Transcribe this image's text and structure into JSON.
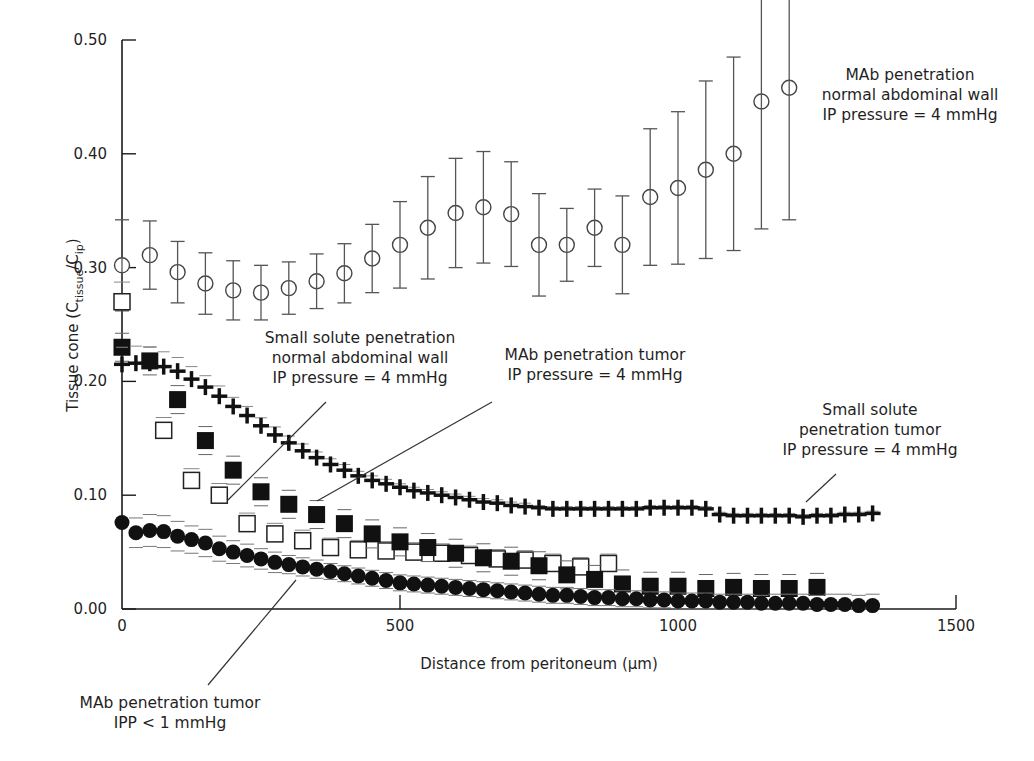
{
  "chart_data": {
    "type": "scatter",
    "title": "",
    "xlabel": "Distance from peritoneum (µm)",
    "ylabel_main": "Tissue cone (C",
    "ylabel_sub1": "tissue",
    "ylabel_mid": "/C",
    "ylabel_sub2": "ip",
    "ylabel_end": ")",
    "xlim": [
      0,
      1500
    ],
    "ylim": [
      0,
      0.5
    ],
    "x_ticks": [
      0,
      500,
      1000,
      1500
    ],
    "x_tick_labels": [
      "0",
      "500",
      "1000",
      "1500"
    ],
    "y_ticks": [
      0,
      0.1,
      0.2,
      0.3,
      0.4,
      0.5
    ],
    "y_tick_labels": [
      "0.00",
      "0.10",
      "0.20",
      "0.30",
      "0.40",
      "0.50"
    ],
    "grid": false,
    "series": [
      {
        "name": "MAb penetration normal abdominal wall, IP pressure = 4 mmHg",
        "marker": "open-circle",
        "x": [
          0,
          50,
          100,
          150,
          200,
          250,
          300,
          350,
          400,
          450,
          500,
          550,
          600,
          650,
          700,
          750,
          800,
          850,
          900,
          950,
          1000,
          1050,
          1100,
          1150,
          1200
        ],
        "y": [
          0.302,
          0.311,
          0.296,
          0.286,
          0.28,
          0.278,
          0.282,
          0.288,
          0.295,
          0.308,
          0.32,
          0.335,
          0.348,
          0.353,
          0.347,
          0.32,
          0.32,
          0.335,
          0.32,
          0.362,
          0.37,
          0.386,
          0.4,
          0.446,
          0.458
        ],
        "err": [
          0.04,
          0.03,
          0.027,
          0.027,
          0.026,
          0.024,
          0.023,
          0.024,
          0.026,
          0.03,
          0.038,
          0.045,
          0.048,
          0.049,
          0.046,
          0.045,
          0.032,
          0.034,
          0.043,
          0.06,
          0.067,
          0.078,
          0.085,
          0.112,
          0.116
        ]
      },
      {
        "name": "Small solute penetration normal abdominal wall, IP pressure = 4 mmHg",
        "marker": "open-square",
        "x": [
          0,
          75,
          125,
          175,
          225,
          275,
          325,
          375,
          425,
          475,
          525,
          575,
          625,
          675,
          725,
          775,
          825,
          875
        ],
        "y": [
          0.27,
          0.157,
          0.113,
          0.1,
          0.075,
          0.066,
          0.06,
          0.054,
          0.052,
          0.051,
          0.05,
          0.049,
          0.047,
          0.044,
          0.043,
          0.04,
          0.037,
          0.04
        ],
        "err": [
          0.012,
          0.006,
          0.005,
          0.005,
          0.004,
          0.004,
          0.004,
          0.003,
          0.003,
          0.003,
          0.003,
          0.003,
          0.003,
          0.003,
          0.003,
          0.003,
          0.003,
          0.003
        ]
      },
      {
        "name": "MAb penetration tumor, IP pressure = 4 mmHg",
        "marker": "filled-square",
        "x": [
          0,
          50,
          100,
          150,
          200,
          250,
          300,
          350,
          400,
          450,
          500,
          550,
          600,
          650,
          700,
          750,
          800,
          850,
          900,
          950,
          1000,
          1050,
          1100,
          1150,
          1200,
          1250
        ],
        "y": [
          0.23,
          0.218,
          0.184,
          0.148,
          0.122,
          0.103,
          0.092,
          0.083,
          0.075,
          0.066,
          0.059,
          0.054,
          0.049,
          0.045,
          0.042,
          0.038,
          0.03,
          0.026,
          0.022,
          0.02,
          0.02,
          0.018,
          0.019,
          0.018,
          0.018,
          0.019
        ],
        "err": [
          0.012,
          0.013,
          0.012,
          0.011,
          0.01,
          0.009,
          0.008,
          0.008,
          0.007,
          0.007,
          0.006,
          0.006,
          0.005,
          0.005,
          0.005,
          0.005,
          0.004,
          0.004,
          0.004,
          0.004,
          0.004,
          0.004,
          0.004,
          0.004,
          0.004,
          0.004
        ]
      },
      {
        "name": "Small solute penetration tumor, IP pressure = 4 mmHg",
        "marker": "cross",
        "x": [
          0,
          25,
          50,
          75,
          100,
          125,
          150,
          175,
          200,
          225,
          250,
          275,
          300,
          325,
          350,
          375,
          400,
          425,
          450,
          475,
          500,
          525,
          550,
          575,
          600,
          625,
          650,
          675,
          700,
          725,
          750,
          775,
          800,
          825,
          850,
          875,
          900,
          925,
          950,
          975,
          1000,
          1025,
          1050,
          1075,
          1100,
          1125,
          1150,
          1175,
          1200,
          1225,
          1250,
          1275,
          1300,
          1325,
          1350
        ],
        "y": [
          0.215,
          0.216,
          0.216,
          0.213,
          0.209,
          0.202,
          0.195,
          0.187,
          0.178,
          0.17,
          0.161,
          0.153,
          0.146,
          0.139,
          0.133,
          0.127,
          0.122,
          0.117,
          0.113,
          0.11,
          0.107,
          0.104,
          0.102,
          0.1,
          0.098,
          0.096,
          0.094,
          0.093,
          0.091,
          0.09,
          0.089,
          0.088,
          0.088,
          0.088,
          0.088,
          0.088,
          0.088,
          0.088,
          0.089,
          0.089,
          0.089,
          0.089,
          0.088,
          0.083,
          0.082,
          0.082,
          0.082,
          0.082,
          0.082,
          0.081,
          0.082,
          0.082,
          0.083,
          0.083,
          0.084
        ],
        "err_upper": [
          0.015,
          0.015,
          0.014,
          0.013,
          0.012,
          0.011,
          0.01,
          0.009,
          0.008,
          0.008,
          0.007,
          0.007,
          0.006,
          0.006,
          0.005,
          0.005,
          0.005,
          0.004,
          0.004,
          0.004,
          0.003,
          0.003,
          0.003,
          0.003,
          0.003,
          0.003,
          0.003,
          0.003,
          0.003,
          0.003,
          0.002,
          0.002,
          0.002,
          0.002,
          0.002,
          0.002,
          0.002,
          0.002,
          0.002,
          0.002,
          0.002,
          0.002,
          0.002,
          0.002,
          0.002,
          0.002,
          0.002,
          0.002,
          0.002,
          0.002,
          0.002,
          0.002,
          0.002,
          0.002,
          0.002
        ]
      },
      {
        "name": "MAb penetration tumor, IPP < 1 mmHg",
        "marker": "filled-circle",
        "x": [
          0,
          25,
          50,
          75,
          100,
          125,
          150,
          175,
          200,
          225,
          250,
          275,
          300,
          325,
          350,
          375,
          400,
          425,
          450,
          475,
          500,
          525,
          550,
          575,
          600,
          625,
          650,
          675,
          700,
          725,
          750,
          775,
          800,
          825,
          850,
          875,
          900,
          925,
          950,
          975,
          1000,
          1025,
          1050,
          1075,
          1100,
          1125,
          1150,
          1175,
          1200,
          1225,
          1250,
          1275,
          1300,
          1325,
          1350
        ],
        "y": [
          0.076,
          0.067,
          0.069,
          0.068,
          0.064,
          0.061,
          0.058,
          0.053,
          0.05,
          0.047,
          0.044,
          0.041,
          0.039,
          0.037,
          0.035,
          0.033,
          0.031,
          0.029,
          0.027,
          0.025,
          0.023,
          0.022,
          0.021,
          0.02,
          0.019,
          0.018,
          0.017,
          0.016,
          0.015,
          0.014,
          0.013,
          0.012,
          0.012,
          0.011,
          0.01,
          0.01,
          0.009,
          0.009,
          0.008,
          0.008,
          0.007,
          0.007,
          0.007,
          0.006,
          0.006,
          0.006,
          0.005,
          0.005,
          0.005,
          0.005,
          0.004,
          0.004,
          0.004,
          0.003,
          0.003
        ],
        "err": [
          0.0,
          0.013,
          0.014,
          0.014,
          0.013,
          0.012,
          0.012,
          0.011,
          0.01,
          0.01,
          0.009,
          0.009,
          0.008,
          0.008,
          0.008,
          0.007,
          0.007,
          0.007,
          0.007,
          0.007,
          0.007,
          0.007,
          0.007,
          0.007,
          0.007,
          0.007,
          0.007,
          0.007,
          0.007,
          0.007,
          0.007,
          0.007,
          0.007,
          0.007,
          0.007,
          0.007,
          0.007,
          0.007,
          0.007,
          0.007,
          0.007,
          0.007,
          0.007,
          0.007,
          0.007,
          0.007,
          0.007,
          0.008,
          0.008,
          0.008,
          0.008,
          0.009,
          0.009,
          0.009,
          0.01
        ]
      }
    ],
    "annotations": [
      {
        "id": "mab-normal",
        "lines": [
          "MAb penetration",
          "normal abdominal wall",
          "IP pressure = 4 mmHg"
        ],
        "left": 790,
        "top": 65,
        "width": 240,
        "leader": null
      },
      {
        "id": "small-normal",
        "lines": [
          "Small solute penetration",
          "normal abdominal wall",
          "IP pressure = 4 mmHg"
        ],
        "left": 240,
        "top": 328,
        "width": 240,
        "leader": [
          326,
          402,
          228,
          500
        ]
      },
      {
        "id": "mab-tumor",
        "lines": [
          "MAb penetration tumor",
          "IP pressure = 4 mmHg"
        ],
        "left": 480,
        "top": 345,
        "width": 230,
        "leader": [
          492,
          402,
          317,
          501
        ]
      },
      {
        "id": "small-tumor",
        "lines": [
          "Small solute",
          "penetration tumor",
          "IP pressure = 4 mmHg"
        ],
        "left": 760,
        "top": 400,
        "width": 220,
        "leader": [
          836,
          474,
          806,
          502
        ]
      },
      {
        "id": "mab-ipp",
        "lines": [
          "MAb penetration tumor",
          "IPP < 1 mmHg"
        ],
        "left": 70,
        "top": 693,
        "width": 200,
        "leader": [
          208,
          685,
          296,
          580
        ]
      }
    ]
  }
}
